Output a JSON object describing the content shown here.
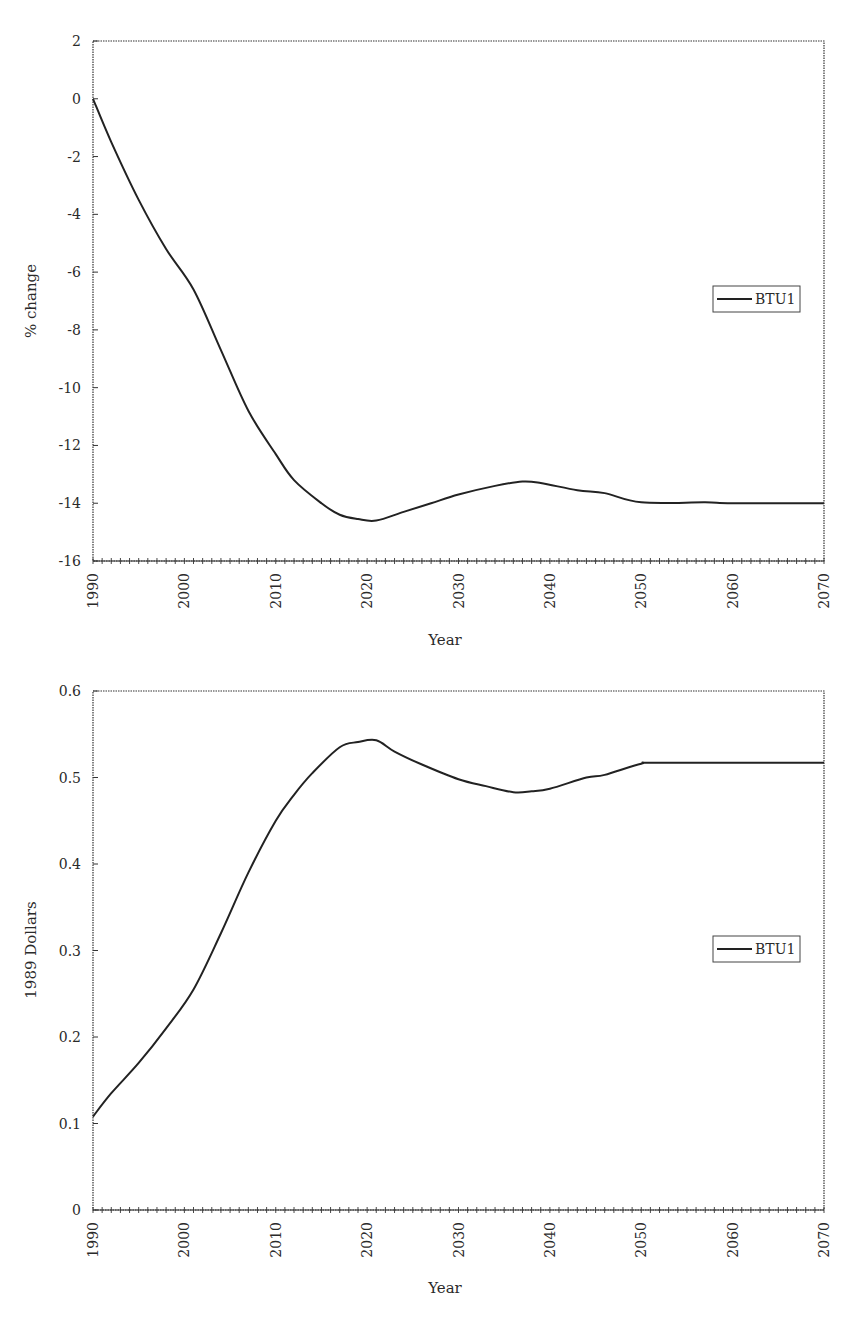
{
  "chart_data": [
    {
      "type": "line",
      "title": "",
      "xlabel": "Year",
      "ylabel": "% change",
      "xlim": [
        1990,
        2070
      ],
      "ylim": [
        -16,
        2
      ],
      "xticks": [
        1990,
        2000,
        2010,
        2020,
        2030,
        2040,
        2050,
        2060,
        2070
      ],
      "yticks": [
        2,
        0,
        -2,
        -4,
        -6,
        -8,
        -10,
        -12,
        -14,
        -16
      ],
      "grid": false,
      "legend_position": "right-middle",
      "series": [
        {
          "name": "BTU1",
          "color": "#222222",
          "x": [
            1990,
            1992,
            1995,
            1998,
            2001,
            2004,
            2007,
            2010,
            2012,
            2015,
            2017,
            2019,
            2021,
            2024,
            2027,
            2030,
            2034,
            2037,
            2039,
            2043,
            2046,
            2050,
            2057,
            2060,
            2070
          ],
          "values": [
            0,
            -1.5,
            -3.5,
            -5.2,
            -6.6,
            -8.7,
            -10.8,
            -12.3,
            -13.2,
            -14.0,
            -14.4,
            -14.55,
            -14.6,
            -14.3,
            -14.0,
            -13.7,
            -13.4,
            -13.25,
            -13.3,
            -13.55,
            -13.65,
            -13.97,
            -13.97,
            -14.0,
            -14.0
          ]
        }
      ]
    },
    {
      "type": "line",
      "title": "",
      "xlabel": "Year",
      "ylabel": "1989 Dollars",
      "xlim": [
        1990,
        2070
      ],
      "ylim": [
        0,
        0.6
      ],
      "xticks": [
        1990,
        2000,
        2010,
        2020,
        2030,
        2040,
        2050,
        2060,
        2070
      ],
      "yticks": [
        0.6,
        0.5,
        0.4,
        0.3,
        0.2,
        0.1,
        0
      ],
      "grid": false,
      "legend_position": "right-middle",
      "series": [
        {
          "name": "BTU1",
          "color": "#222222",
          "x": [
            1990,
            1992,
            1995,
            1998,
            2001,
            2004,
            2007,
            2010,
            2012,
            2014,
            2017,
            2019,
            2021,
            2023,
            2026,
            2030,
            2033,
            2036,
            2038,
            2040,
            2044,
            2046,
            2050,
            2052,
            2070
          ],
          "values": [
            0.108,
            0.135,
            0.17,
            0.21,
            0.255,
            0.32,
            0.39,
            0.45,
            0.48,
            0.505,
            0.535,
            0.541,
            0.543,
            0.53,
            0.515,
            0.498,
            0.49,
            0.483,
            0.484,
            0.487,
            0.5,
            0.503,
            0.516,
            0.517,
            0.517
          ]
        }
      ]
    }
  ],
  "charts": [
    {
      "ylabel": "% change",
      "xlabel": "Year",
      "legend_label": "BTU1",
      "ytick_labels": [
        "2",
        "0",
        "-2",
        "-4",
        "-6",
        "-8",
        "-10",
        "-12",
        "-14",
        "-16"
      ],
      "xtick_labels": [
        "1990",
        "2000",
        "2010",
        "2020",
        "2030",
        "2040",
        "2050",
        "2060",
        "2070"
      ]
    },
    {
      "ylabel": "1989 Dollars",
      "xlabel": "Year",
      "legend_label": "BTU1",
      "ytick_labels": [
        "0.6",
        "0.5",
        "0.4",
        "0.3",
        "0.2",
        "0.1",
        "0"
      ],
      "xtick_labels": [
        "1990",
        "2000",
        "2010",
        "2020",
        "2030",
        "2040",
        "2050",
        "2060",
        "2070"
      ]
    }
  ]
}
